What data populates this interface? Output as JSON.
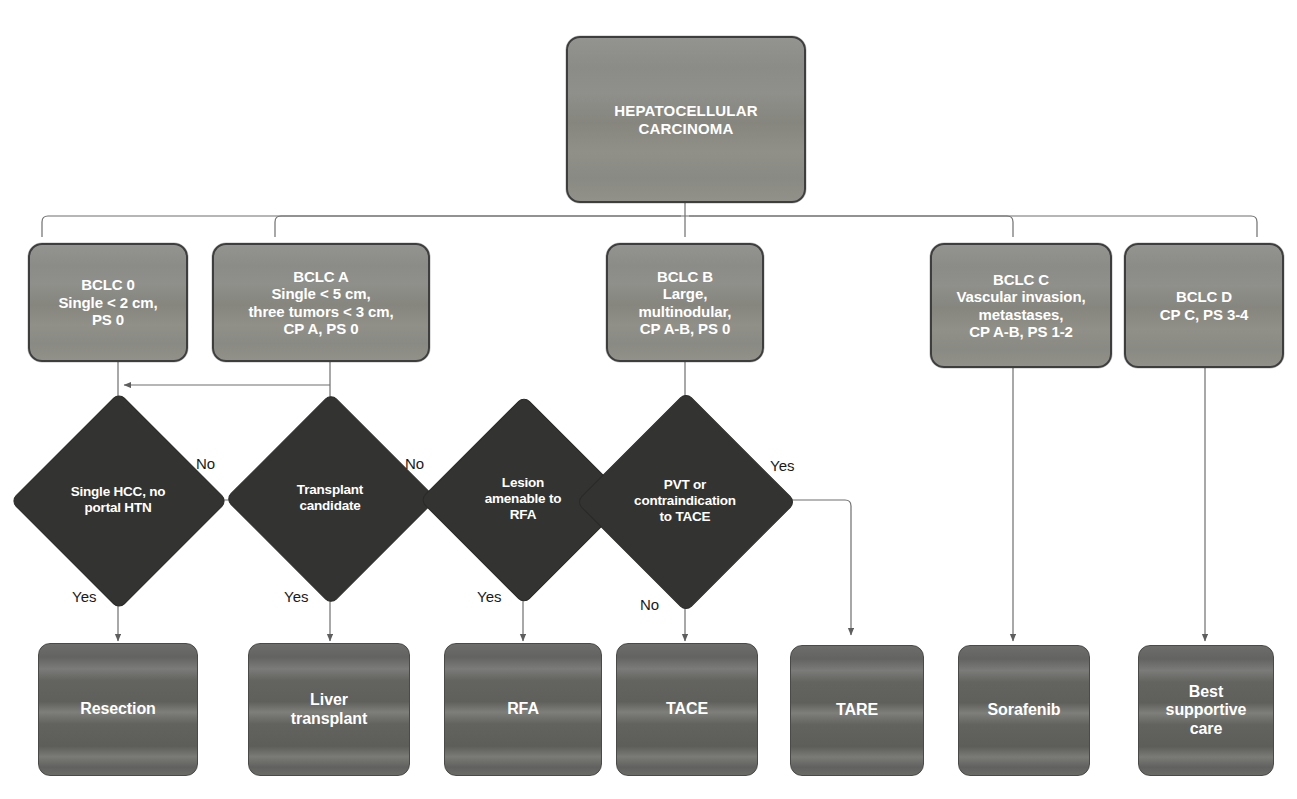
{
  "diagram": {
    "title": "HEPATOCELLULAR\nCARCINOMA",
    "root": {
      "id": "hcc-root",
      "label": "HEPATOCELLULAR\nCARCINOMA"
    },
    "stages": [
      {
        "id": "bclc-0",
        "label": "BCLC 0\nSingle < 2 cm,\nPS 0"
      },
      {
        "id": "bclc-a",
        "label": "BCLC A\nSingle < 5 cm,\nthree tumors < 3 cm,\nCP A, PS 0"
      },
      {
        "id": "bclc-b",
        "label": "BCLC B\nLarge,\nmultinodular,\nCP A-B, PS 0"
      },
      {
        "id": "bclc-c",
        "label": "BCLC C\nVascular invasion,\nmetastases,\nCP A-B, PS 1-2"
      },
      {
        "id": "bclc-d",
        "label": "BCLC D\nCP C, PS 3-4"
      }
    ],
    "decisions": [
      {
        "id": "decision-single-hcc",
        "label": "Single HCC, no\nportal HTN"
      },
      {
        "id": "decision-transplant",
        "label": "Transplant\ncandidate"
      },
      {
        "id": "decision-rfa",
        "label": "Lesion\namenable to\nRFA"
      },
      {
        "id": "decision-pvt",
        "label": "PVT or\ncontraindication\nto TACE"
      }
    ],
    "treatments": [
      {
        "id": "treatment-resection",
        "label": "Resection"
      },
      {
        "id": "treatment-liver-transplant",
        "label": "Liver\ntransplant"
      },
      {
        "id": "treatment-rfa",
        "label": "RFA"
      },
      {
        "id": "treatment-tace",
        "label": "TACE"
      },
      {
        "id": "treatment-tare",
        "label": "TARE"
      },
      {
        "id": "treatment-sorafenib",
        "label": "Sorafenib"
      },
      {
        "id": "treatment-best-supportive-care",
        "label": "Best\nsupportive\ncare"
      }
    ],
    "edge_labels": {
      "no_single_hcc": "No",
      "no_transplant": "No",
      "yes_single_hcc": "Yes",
      "yes_transplant": "Yes",
      "yes_rfa": "Yes",
      "yes_pvt": "Yes",
      "no_pvt": "No"
    },
    "colors": {
      "background": "#ffffff",
      "class_box": "#8c8c88",
      "class_box_border": "#3e3e3e",
      "decision_diamond": "#333331",
      "treatment_box": "#696966",
      "connector": "#6e6e6e",
      "node_text": "#ffffff",
      "edge_label_text": "#1a1a1a"
    }
  }
}
